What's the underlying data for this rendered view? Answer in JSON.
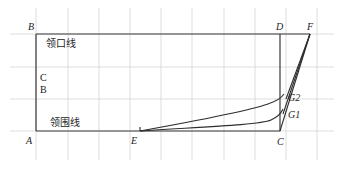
{
  "diagram": {
    "type": "pattern-drafting-collar",
    "labels": {
      "neckline_top": "领口线",
      "neckline_bottom": "领围线",
      "cb_line1": "C",
      "cb_line2": "B"
    },
    "points": {
      "A": "A",
      "B": "B",
      "C": "C",
      "D": "D",
      "E": "E",
      "F": "F",
      "G1": "G1",
      "G2": "G2"
    },
    "colors": {
      "grid": "#d4d4d4",
      "lines": "#2e2e2e",
      "background": "#ffffff"
    }
  }
}
